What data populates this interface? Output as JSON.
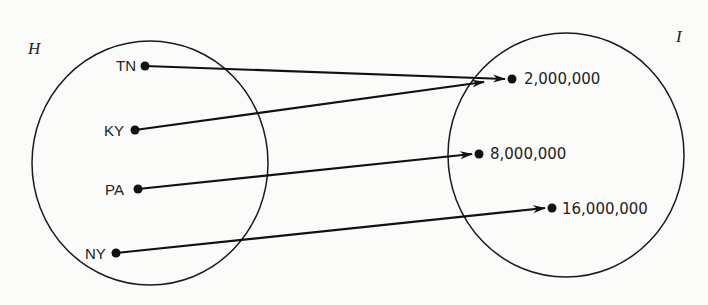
{
  "diagram": {
    "type": "function-mapping",
    "domain_set": {
      "label": "H",
      "elements": [
        {
          "id": "TN",
          "label": "TN"
        },
        {
          "id": "KY",
          "label": "KY"
        },
        {
          "id": "PA",
          "label": "PA"
        },
        {
          "id": "NY",
          "label": "NY"
        }
      ]
    },
    "codomain_set": {
      "label": "I",
      "elements": [
        {
          "id": "v2m",
          "label": "2,000,000"
        },
        {
          "id": "v8m",
          "label": "8,000,000"
        },
        {
          "id": "v16m",
          "label": "16,000,000"
        }
      ]
    },
    "mappings": [
      {
        "from": "TN",
        "to": "2,000,000"
      },
      {
        "from": "KY",
        "to": "2,000,000"
      },
      {
        "from": "PA",
        "to": "8,000,000"
      },
      {
        "from": "NY",
        "to": "16,000,000"
      }
    ],
    "colors": {
      "ink": "#111111",
      "background": "#fbfbfa"
    }
  }
}
